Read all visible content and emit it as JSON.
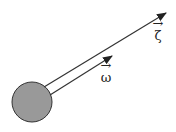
{
  "diagram": {
    "body": {
      "shape": "circle",
      "fill": "#999999",
      "stroke": "#333333"
    },
    "vectors": [
      {
        "name": "zeta",
        "label": "ζ",
        "color": "#333333"
      },
      {
        "name": "omega",
        "label": "ω",
        "color": "#333333"
      }
    ],
    "vector_arrow_glyph": "→"
  }
}
